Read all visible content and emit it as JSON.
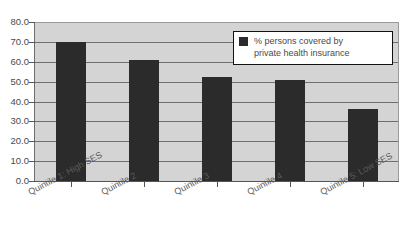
{
  "chart_data": {
    "type": "bar",
    "title": "insurance",
    "title_note": "title is cropped by the top edge of the screenshot; only the trailing word is visible",
    "xlabel": "",
    "ylabel": "",
    "ylim": [
      0,
      80
    ],
    "ytick_step": 10,
    "grid": true,
    "legend_position": "top-right",
    "categories": [
      "Quintile 1: High SES",
      "Quintile 2",
      "Quintile 3",
      "Quintile 4",
      "Quintile 5: Low SES"
    ],
    "ytick_labels": [
      "80.0",
      "70.0",
      "60.0",
      "50.0",
      "40.0",
      "30.0",
      "20.0",
      "10.0",
      "0.0"
    ],
    "series": [
      {
        "name": "% persons covered by private health insurance",
        "color": "#2b2b2b",
        "values": [
          70.0,
          61.0,
          52.5,
          51.0,
          36.0
        ]
      }
    ]
  },
  "legend": {
    "entries": [
      {
        "label": "% persons covered by private health insurance",
        "line1": "% persons covered by",
        "line2": "private health insurance",
        "color": "#2b2b2b"
      }
    ]
  },
  "colors": {
    "plot_background": "#d4d4d4",
    "page_background": "#ffffff",
    "gridline": "#6f6f6f",
    "axis": "#555555",
    "bar": "#2b2b2b",
    "text": "#4a4a4a"
  }
}
